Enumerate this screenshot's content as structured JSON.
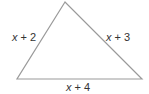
{
  "diagram": {
    "type": "triangle",
    "stroke_color": "#9a9a9a",
    "vertices": {
      "top": [
        65,
        2
      ],
      "bottom_left": [
        17,
        79
      ],
      "bottom_right": [
        142,
        79
      ]
    },
    "sides": {
      "left": {
        "variable": "x",
        "operator": "+",
        "constant": "2"
      },
      "right": {
        "variable": "x",
        "operator": "+",
        "constant": "3"
      },
      "bottom": {
        "variable": "x",
        "operator": "+",
        "constant": "4"
      }
    }
  }
}
